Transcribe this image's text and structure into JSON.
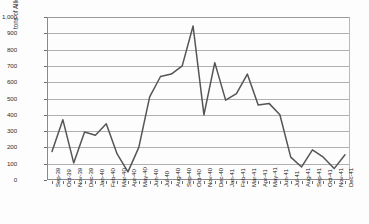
{
  "chart_data": {
    "type": "line",
    "title": "",
    "xlabel": "",
    "ylabel": "tons of Allied and neutral shipping sunk",
    "ylim": [
      0,
      1000
    ],
    "ytick_step": 100,
    "ytick_labels": [
      "1,000",
      "900",
      "800",
      "700",
      "600",
      "500",
      "400",
      "300",
      "200",
      "100",
      "0"
    ],
    "ytick_values": [
      1000,
      900,
      800,
      700,
      600,
      500,
      400,
      300,
      200,
      100,
      0
    ],
    "grid": true,
    "legend": "none",
    "categories": [
      "Sep-39",
      "Oct-39",
      "Nov-39",
      "Dec-39",
      "Jan-40",
      "Feb-40",
      "Mar-40",
      "Apr-40",
      "May-40",
      "Jun-40",
      "Jul-40",
      "Aug-40",
      "Sep-40",
      "Oct-40",
      "Nov-40",
      "Dec-40",
      "Jan-41",
      "Feb-41",
      "Mar-41",
      "Apr-41",
      "May-41",
      "Jun-41",
      "Jul-41",
      "Aug-41",
      "Sep-41",
      "Oct-41",
      "Nov-41",
      "Dec-41"
    ],
    "values": [
      175,
      370,
      105,
      295,
      275,
      345,
      160,
      50,
      200,
      510,
      635,
      650,
      700,
      945,
      400,
      720,
      490,
      530,
      650,
      460,
      470,
      400,
      140,
      80,
      185,
      140,
      70,
      155
    ],
    "series_color": "#555555",
    "grid_color": "#b0b0b0",
    "axis_color": "#8a8a8a"
  }
}
